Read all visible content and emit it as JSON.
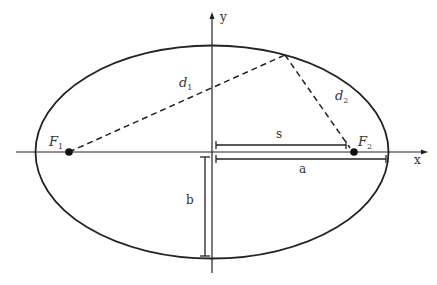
{
  "diagram": {
    "type": "ellipse-geometry",
    "colors": {
      "stroke": "#222222",
      "text": "#333333",
      "background": "#ffffff"
    },
    "axes": {
      "x_label": "x",
      "y_label": "y"
    },
    "foci": [
      {
        "name": "F",
        "sub": "1"
      },
      {
        "name": "F",
        "sub": "2"
      }
    ],
    "distances": [
      {
        "name": "d",
        "sub": "1"
      },
      {
        "name": "d",
        "sub": "2"
      }
    ],
    "measures": {
      "s_label": "s",
      "a_label": "a",
      "b_label": "b"
    }
  }
}
